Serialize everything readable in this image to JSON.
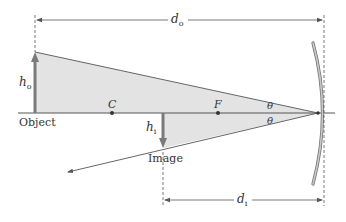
{
  "colors": {
    "background": "#ffffff",
    "shade": "#e3e3e3",
    "line": "#555555",
    "arrow": "#7a7a7a",
    "mirror_fill": "#bdbdbd",
    "mirror_edge": "#777777",
    "text": "#333333"
  },
  "labels": {
    "object": "Object",
    "image": "Image",
    "center_point": "C",
    "focal_point": "F",
    "angle_top": "θ",
    "angle_bottom": "θ",
    "object_height": {
      "main": "h",
      "sub": "o"
    },
    "image_height": {
      "main": "h",
      "sub": "i"
    },
    "object_distance": {
      "main": "d",
      "sub": "o"
    },
    "image_distance": {
      "main": "d",
      "sub": "i"
    }
  },
  "elements": [
    {
      "name": "principal-axis",
      "type": "line"
    },
    {
      "name": "object-arrow",
      "type": "arrow",
      "direction": "up"
    },
    {
      "name": "image-arrow",
      "type": "arrow",
      "direction": "down"
    },
    {
      "name": "incident-ray",
      "type": "ray"
    },
    {
      "name": "reflected-ray",
      "type": "ray"
    },
    {
      "name": "concave-mirror",
      "type": "mirror"
    },
    {
      "name": "object-distance-dimension",
      "type": "dimension"
    },
    {
      "name": "image-distance-dimension",
      "type": "dimension"
    }
  ]
}
